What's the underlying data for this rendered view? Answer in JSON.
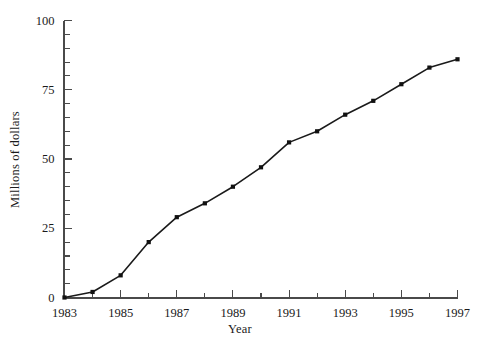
{
  "chart_data": {
    "type": "line",
    "title": "",
    "subtitle": "",
    "xlabel": "Year",
    "ylabel": "Millions of dollars",
    "x": [
      1983,
      1984,
      1985,
      1986,
      1987,
      1988,
      1989,
      1990,
      1991,
      1992,
      1993,
      1994,
      1995,
      1996,
      1997
    ],
    "values": [
      0,
      2,
      8,
      20,
      29,
      34,
      40,
      47,
      56,
      60,
      66,
      71,
      77,
      83,
      86
    ],
    "series": [
      {
        "name": "Millions of dollars",
        "values": [
          0,
          2,
          8,
          20,
          29,
          34,
          40,
          47,
          56,
          60,
          66,
          71,
          77,
          83,
          86
        ]
      }
    ],
    "xlim": [
      1983,
      1997
    ],
    "ylim": [
      0,
      100
    ],
    "x_tick_labels": [
      "1983",
      "1985",
      "1987",
      "1989",
      "1991",
      "1993",
      "1995",
      "1997"
    ],
    "x_tick_label_values": [
      1983,
      1985,
      1987,
      1989,
      1991,
      1993,
      1995,
      1997
    ],
    "x_minor_ticks": [
      1983,
      1984,
      1985,
      1986,
      1987,
      1988,
      1989,
      1990,
      1991,
      1992,
      1993,
      1994,
      1995,
      1996,
      1997
    ],
    "y_tick_labels": [
      "0",
      "25",
      "50",
      "75",
      "100"
    ],
    "y_tick_label_values": [
      0,
      25,
      50,
      75,
      100
    ],
    "y_minor_ticks": [
      0,
      5,
      10,
      15,
      20,
      25,
      30,
      35,
      40,
      45,
      50,
      55,
      60,
      65,
      70,
      75,
      80,
      85,
      90,
      95,
      100
    ],
    "grid": false,
    "legend": false,
    "legend_position": "none",
    "marker": "filled-square",
    "line_color": "#1a1a1a",
    "marker_color": "#111111",
    "axis_color": "#4a4a4a",
    "background_color": "#ffffff"
  }
}
